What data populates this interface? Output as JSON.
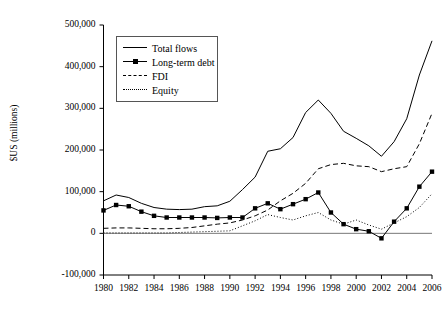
{
  "figure": {
    "background": "#ffffff",
    "ink": "#000000"
  },
  "axis": {
    "ylabel": "$US (millions)",
    "xlabel": "",
    "yticks": [
      "500,000",
      "400,000",
      "300,000",
      "200,000",
      "100,000",
      "0",
      "-100,000"
    ],
    "xticks": [
      "1980",
      "1982",
      "1984",
      "1986",
      "1988",
      "1990",
      "1992",
      "1994",
      "1996",
      "1998",
      "2000",
      "2002",
      "2004",
      "2006"
    ]
  },
  "legend": {
    "position": "top-left-inside",
    "items": [
      {
        "label": "Total flows",
        "key": "solid-line"
      },
      {
        "label": "Long-term debt",
        "key": "solid-line-square-marker"
      },
      {
        "label": "FDI",
        "key": "dashed-line"
      },
      {
        "label": "Equity",
        "key": "dotted-line"
      }
    ]
  },
  "chart_data": {
    "type": "line",
    "title": "",
    "xlabel": "",
    "ylabel": "$US (millions)",
    "xlim": [
      1980,
      2006
    ],
    "ylim": [
      -100000,
      500000
    ],
    "ytick_values": [
      -100000,
      0,
      100000,
      200000,
      300000,
      400000,
      500000
    ],
    "xtick_values": [
      1980,
      1982,
      1984,
      1986,
      1988,
      1990,
      1992,
      1994,
      1996,
      1998,
      2000,
      2002,
      2004,
      2006
    ],
    "grid": false,
    "legend_position": "upper left",
    "x": [
      1980,
      1981,
      1982,
      1983,
      1984,
      1985,
      1986,
      1987,
      1988,
      1989,
      1990,
      1991,
      1992,
      1993,
      1994,
      1995,
      1996,
      1997,
      1998,
      1999,
      2000,
      2001,
      2002,
      2003,
      2004,
      2005,
      2006
    ],
    "series": [
      {
        "name": "Total flows",
        "style": "solid",
        "marker": "none",
        "values": [
          78000,
          92000,
          86000,
          72000,
          62000,
          58000,
          57000,
          58000,
          64000,
          66000,
          77000,
          105000,
          135000,
          197000,
          203000,
          230000,
          290000,
          320000,
          288000,
          245000,
          228000,
          210000,
          185000,
          220000,
          275000,
          380000,
          462000
        ]
      },
      {
        "name": "Long-term debt",
        "style": "solid",
        "marker": "square",
        "values": [
          55000,
          68000,
          65000,
          52000,
          42000,
          38000,
          38000,
          38000,
          38000,
          37000,
          38000,
          38000,
          60000,
          72000,
          58000,
          70000,
          82000,
          98000,
          50000,
          22000,
          10000,
          5000,
          -12000,
          28000,
          60000,
          112000,
          148000
        ]
      },
      {
        "name": "FDI",
        "style": "dashed",
        "marker": "none",
        "values": [
          12000,
          13000,
          13000,
          12000,
          11000,
          11000,
          12000,
          14000,
          18000,
          22000,
          25000,
          32000,
          42000,
          56000,
          78000,
          96000,
          120000,
          155000,
          165000,
          168000,
          162000,
          160000,
          148000,
          155000,
          160000,
          215000,
          288000
        ]
      },
      {
        "name": "Equity",
        "style": "dotted",
        "marker": "none",
        "values": [
          1000,
          1000,
          1000,
          1000,
          1000,
          1000,
          2000,
          3000,
          4000,
          5000,
          6000,
          18000,
          30000,
          45000,
          38000,
          32000,
          42000,
          50000,
          32000,
          22000,
          32000,
          20000,
          10000,
          25000,
          40000,
          62000,
          95000
        ]
      }
    ]
  }
}
